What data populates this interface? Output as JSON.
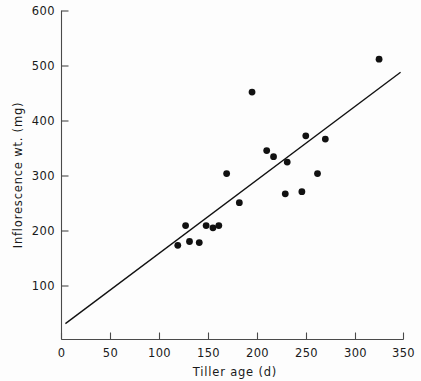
{
  "chart_data": {
    "type": "scatter",
    "title": "",
    "xlabel": "Tiller age  (d)",
    "ylabel": "Inflorescence wt. (mg)",
    "xlim": [
      0,
      350
    ],
    "ylim": [
      0,
      600
    ],
    "xticks": [
      0,
      50,
      100,
      150,
      200,
      250,
      300,
      350
    ],
    "yticks": [
      0,
      100,
      200,
      300,
      400,
      500,
      600
    ],
    "xtick_labels": [
      "0",
      "50",
      "100",
      "150",
      "200",
      "250",
      "300",
      "350"
    ],
    "ytick_labels": [
      "",
      "100",
      "200",
      "300",
      "400",
      "500",
      "600"
    ],
    "grid": false,
    "legend": "none",
    "marker": "filled-circle",
    "x": [
      119,
      127,
      131,
      141,
      148,
      155,
      157,
      162,
      169,
      182,
      195,
      210,
      217,
      229,
      231,
      246,
      250,
      262,
      263,
      270,
      325
    ],
    "y": [
      172,
      208,
      179,
      177,
      208,
      204,
      204,
      208,
      303,
      250,
      452,
      345,
      334,
      266,
      324,
      270,
      372,
      303,
      303,
      366,
      512
    ],
    "points": [
      {
        "x": 119,
        "y": 172
      },
      {
        "x": 127,
        "y": 208
      },
      {
        "x": 131,
        "y": 179
      },
      {
        "x": 141,
        "y": 177
      },
      {
        "x": 148,
        "y": 208
      },
      {
        "x": 155,
        "y": 204
      },
      {
        "x": 161,
        "y": 208
      },
      {
        "x": 169,
        "y": 303
      },
      {
        "x": 182,
        "y": 250
      },
      {
        "x": 195,
        "y": 452
      },
      {
        "x": 210,
        "y": 345
      },
      {
        "x": 217,
        "y": 334
      },
      {
        "x": 229,
        "y": 266
      },
      {
        "x": 231,
        "y": 324
      },
      {
        "x": 246,
        "y": 270
      },
      {
        "x": 250,
        "y": 372
      },
      {
        "x": 262,
        "y": 303
      },
      {
        "x": 270,
        "y": 366
      },
      {
        "x": 325,
        "y": 512
      }
    ],
    "trend_line": {
      "type": "linear-fit",
      "x_start": 4,
      "y_start": 29,
      "x_end": 347,
      "y_end": 488
    },
    "colors": {
      "point": "#111111",
      "line": "#111111",
      "axis": "#4a4a4a",
      "background": "#fdfdfd"
    }
  }
}
